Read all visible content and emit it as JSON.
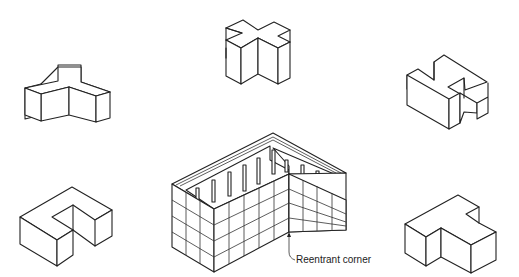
{
  "diagram": {
    "type": "isometric building plan shapes",
    "shapes": [
      {
        "id": "t-shape-left",
        "description": "T-shaped block (top-left)"
      },
      {
        "id": "cross-shape",
        "description": "Cross/plus-shaped block (top-center)"
      },
      {
        "id": "h-shape",
        "description": "H-shaped block (top-right)"
      },
      {
        "id": "u-shape",
        "description": "U/C-shaped block (bottom-left)"
      },
      {
        "id": "l-building",
        "description": "L-shaped building with grid facade (bottom-center)"
      },
      {
        "id": "t-shape-right",
        "description": "T-shaped block (bottom-right)"
      }
    ],
    "annotations": [
      {
        "label": "Reentrant corner",
        "target": "l-building"
      }
    ],
    "colors": {
      "line": "#222222",
      "background": "#ffffff"
    }
  }
}
